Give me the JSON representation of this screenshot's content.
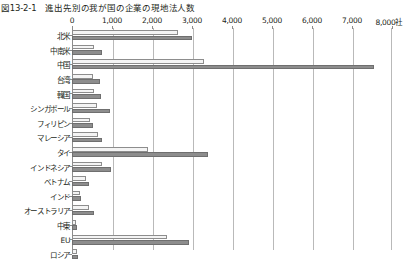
{
  "figure": {
    "number": "図13-2-1",
    "title": "進出先別の我が国の企業の現地法人数"
  },
  "chart_data": {
    "type": "bar",
    "orientation": "horizontal",
    "title": "進出先別の我が国の企業の現地法人数",
    "xlabel": "",
    "ylabel": "",
    "unit": "社",
    "xlim": [
      0,
      8000
    ],
    "xticks": [
      0,
      1000,
      2000,
      3000,
      4000,
      5000,
      6000,
      7000,
      8000
    ],
    "xtick_labels": [
      "0",
      "1,000",
      "2,000",
      "3,000",
      "4,000",
      "5,000",
      "6,000",
      "7,000",
      "8,000社"
    ],
    "grid": true,
    "legend": "none",
    "categories": [
      "北米",
      "中南米",
      "中国",
      "台湾",
      "韓国",
      "シンガポール",
      "フィリピン",
      "マレーシア",
      "タイ",
      "インドネシア",
      "ベトナム",
      "インド",
      "オーストラリア",
      "中東",
      "EU",
      "ロシア"
    ],
    "series": [
      {
        "name": "series-1",
        "color": "#f4f4f4",
        "values": [
          2650,
          560,
          3300,
          530,
          560,
          620,
          460,
          640,
          1900,
          760,
          340,
          190,
          430,
          90,
          2380,
          120
        ]
      },
      {
        "name": "series-2",
        "color": "#8d8d8d",
        "values": [
          3010,
          760,
          7550,
          700,
          720,
          950,
          520,
          760,
          3400,
          980,
          430,
          230,
          560,
          130,
          2920,
          150
        ]
      }
    ]
  }
}
